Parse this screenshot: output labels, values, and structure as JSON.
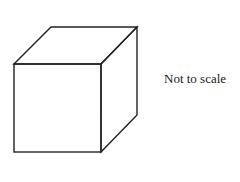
{
  "figure": {
    "shape": "cube",
    "caption": "Not to scale",
    "stroke_color": "#222222",
    "background_color": "#ffffff",
    "vertices": {
      "front_top_left": [
        14,
        64
      ],
      "front_top_right": [
        101,
        64
      ],
      "front_bottom_left": [
        14,
        152
      ],
      "front_bottom_right": [
        101,
        152
      ],
      "back_top_left": [
        51,
        27
      ],
      "back_top_right": [
        137,
        27
      ],
      "back_bottom_right": [
        137,
        115
      ]
    }
  }
}
